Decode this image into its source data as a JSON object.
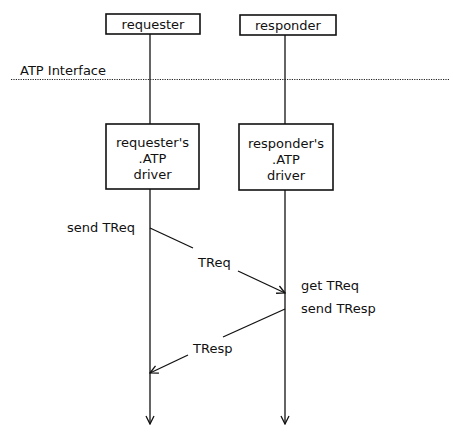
{
  "diagram": {
    "type": "sequence",
    "participants": [
      {
        "id": "requester",
        "label": "requester",
        "driver_lines": [
          "requester's",
          ".ATP",
          "driver"
        ]
      },
      {
        "id": "responder",
        "label": "responder",
        "driver_lines": [
          "responder's",
          ".ATP",
          "driver"
        ]
      }
    ],
    "interface_label": "ATP Interface",
    "events": [
      {
        "participant": "requester",
        "label": "send TReq"
      },
      {
        "participant": "responder",
        "label": "get TReq"
      },
      {
        "participant": "responder",
        "label": "send TResp"
      }
    ],
    "messages": [
      {
        "from": "requester",
        "to": "responder",
        "label": "TReq"
      },
      {
        "from": "responder",
        "to": "requester",
        "label": "TResp"
      }
    ],
    "colors": {
      "ink": "#111111",
      "background": "#ffffff"
    }
  }
}
